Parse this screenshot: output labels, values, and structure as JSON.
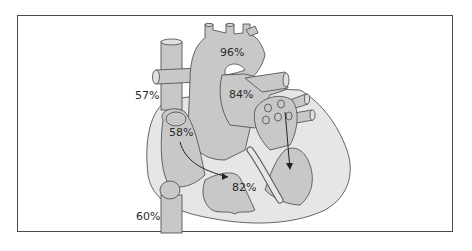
{
  "diagram": {
    "labels": {
      "aorta": "96%",
      "pulmonary_artery": "84%",
      "superior_vena_cava": "57%",
      "right_atrium": "58%",
      "right_ventricle": "82%",
      "inferior_vena_cava": "60%"
    },
    "colors": {
      "tissue_dark": "#c8c8c8",
      "tissue_light": "#e6e6e6",
      "outline": "#555555",
      "frame": "#4a4a4a",
      "text": "#2a2a2a"
    }
  }
}
